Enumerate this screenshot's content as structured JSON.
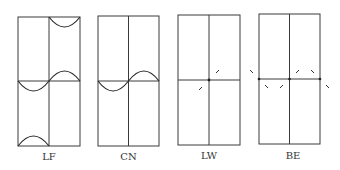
{
  "panels": [
    {
      "id": "LF",
      "label": "LF"
    },
    {
      "id": "CN",
      "label": "CN"
    },
    {
      "id": "LW",
      "label": "LW"
    },
    {
      "id": "BE",
      "label": "BE"
    }
  ],
  "colors": {
    "line": "#3a3a3a",
    "background": "#ffffff"
  }
}
